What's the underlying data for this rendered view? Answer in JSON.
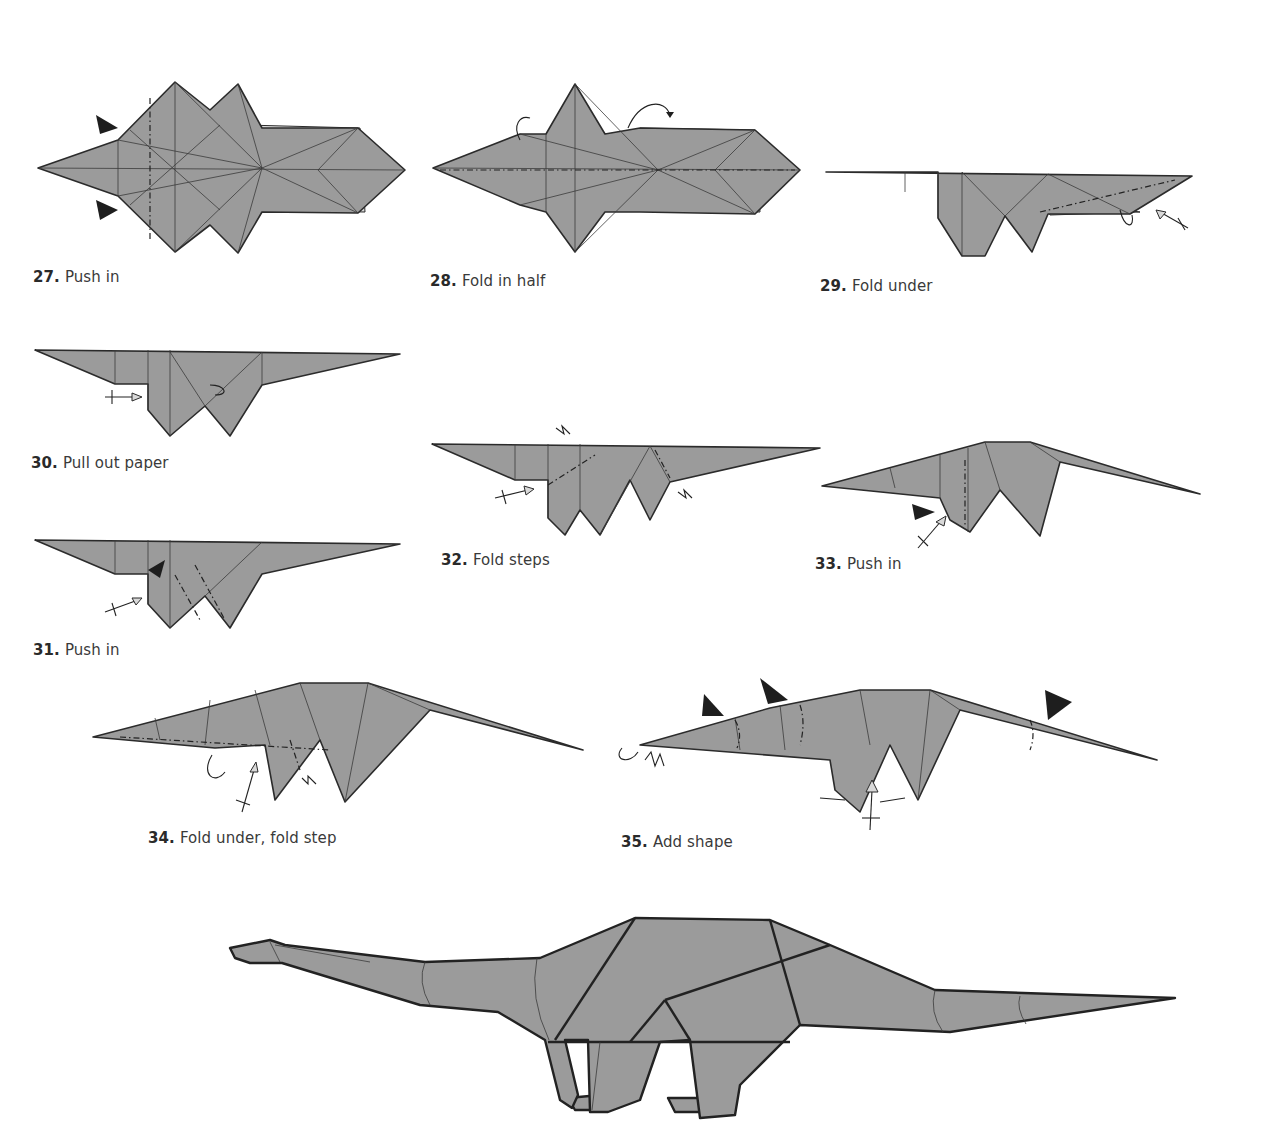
{
  "page": {
    "colors": {
      "paper": "#9b9b9b",
      "paper_light": "#d9d9d9",
      "line": "#2b2b2b",
      "background": "#ffffff",
      "text": "#3a3a3a"
    }
  },
  "steps": [
    {
      "number": "27.",
      "text": "Push in"
    },
    {
      "number": "28.",
      "text": "Fold in half"
    },
    {
      "number": "29.",
      "text": "Fold under"
    },
    {
      "number": "30.",
      "text": "Pull out paper"
    },
    {
      "number": "31.",
      "text": "Push in"
    },
    {
      "number": "32.",
      "text": "Fold steps"
    },
    {
      "number": "33.",
      "text": "Push in"
    },
    {
      "number": "34.",
      "text": "Fold under, fold step"
    },
    {
      "number": "35.",
      "text": "Add shape"
    }
  ],
  "final_model": {
    "icon": "dinosaur-origami-model"
  }
}
